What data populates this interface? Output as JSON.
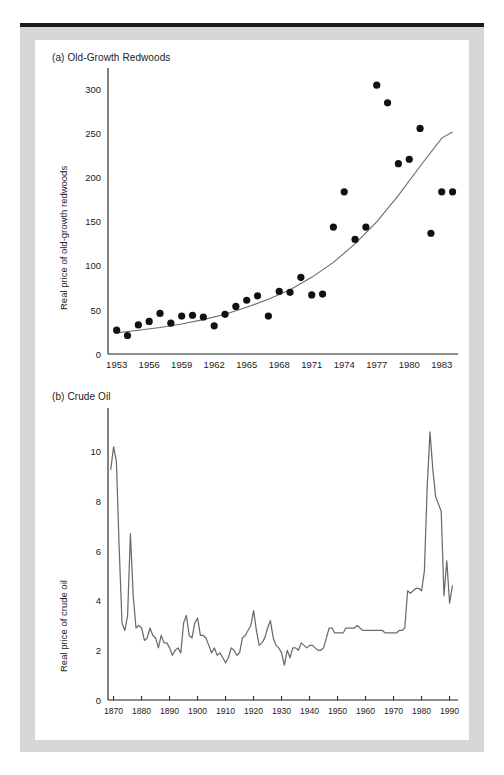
{
  "page": {
    "frame_color": "#d6d6d6",
    "rule_color": "#1a1a1a",
    "background": "#ffffff"
  },
  "panels": [
    {
      "key": "a",
      "label": "(a) Old-Growth Redwoods"
    },
    {
      "key": "b",
      "label": "(b) Crude Oil"
    }
  ],
  "chart_data": [
    {
      "type": "scatter",
      "title": "(a) Old-Growth Redwoods",
      "xlabel": "",
      "ylabel": "Real price of old-growth redwoods",
      "xlim": [
        1952.2,
        1984.5
      ],
      "ylim": [
        0,
        320
      ],
      "grid": false,
      "legend": null,
      "xticks": [
        1953,
        1956,
        1959,
        1962,
        1965,
        1968,
        1971,
        1974,
        1977,
        1980,
        1983
      ],
      "xticklabels": [
        "1953",
        "1956",
        "1959",
        "1962",
        "1965",
        "1968",
        "1971",
        "1974",
        "1977",
        "1980",
        "1983"
      ],
      "yticks": [
        0,
        50,
        100,
        150,
        200,
        250,
        300
      ],
      "yticklabels": [
        "0",
        "50",
        "100",
        "150",
        "200",
        "250",
        "300"
      ],
      "marker_color": "#111111",
      "fit_color": "#6b6b6b",
      "x": [
        1953,
        1954,
        1955,
        1956,
        1957,
        1958,
        1959,
        1960,
        1961,
        1962,
        1963,
        1964,
        1965,
        1966,
        1967,
        1968,
        1969,
        1970,
        1971,
        1972,
        1973,
        1974,
        1975,
        1976,
        1977,
        1978,
        1979,
        1980,
        1981,
        1982,
        1983,
        1984
      ],
      "y": [
        27,
        21,
        33,
        37,
        46,
        35,
        43,
        44,
        42,
        32,
        45,
        54,
        61,
        66,
        43,
        71,
        70,
        87,
        67,
        68,
        144,
        184,
        130,
        144,
        305,
        285,
        216,
        221,
        256,
        137,
        184,
        184
      ],
      "series": [
        {
          "name": "Real price of old-growth redwoods",
          "kind": "scatter",
          "values": [
            27,
            21,
            33,
            37,
            46,
            35,
            43,
            44,
            42,
            32,
            45,
            54,
            61,
            66,
            43,
            71,
            70,
            87,
            67,
            68,
            144,
            184,
            130,
            144,
            305,
            285,
            216,
            221,
            256,
            137,
            184,
            184
          ]
        },
        {
          "name": "Exponential trend fit",
          "kind": "line",
          "x": [
            1953,
            1955,
            1957,
            1959,
            1961,
            1963,
            1965,
            1967,
            1969,
            1971,
            1973,
            1975,
            1977,
            1979,
            1981,
            1983,
            1984
          ],
          "values": [
            24,
            27,
            30,
            34,
            39,
            45,
            53,
            62,
            73,
            87,
            104,
            125,
            150,
            180,
            213,
            245,
            252
          ]
        }
      ]
    },
    {
      "type": "line",
      "title": "(b) Crude Oil",
      "xlabel": "",
      "ylabel": "Real price of crude oil",
      "xlim": [
        1868,
        1993
      ],
      "ylim": [
        0,
        11.6
      ],
      "grid": false,
      "legend": null,
      "xticks": [
        1870,
        1880,
        1890,
        1900,
        1910,
        1920,
        1930,
        1940,
        1950,
        1960,
        1970,
        1980,
        1990
      ],
      "xticklabels": [
        "1870",
        "1880",
        "1890",
        "1900",
        "1910",
        "1920",
        "1930",
        "1940",
        "1950",
        "1960",
        "1970",
        "1980",
        "1990"
      ],
      "yticks": [
        0,
        2,
        4,
        6,
        8,
        10
      ],
      "yticklabels": [
        "0",
        "2",
        "4",
        "6",
        "8",
        "10"
      ],
      "line_color": "#6b6b6b",
      "x": [
        1869,
        1870,
        1871,
        1872,
        1873,
        1874,
        1875,
        1876,
        1877,
        1878,
        1879,
        1880,
        1881,
        1882,
        1883,
        1884,
        1885,
        1886,
        1887,
        1888,
        1889,
        1890,
        1891,
        1892,
        1893,
        1894,
        1895,
        1896,
        1897,
        1898,
        1899,
        1900,
        1901,
        1902,
        1903,
        1904,
        1905,
        1906,
        1907,
        1908,
        1909,
        1910,
        1911,
        1912,
        1913,
        1914,
        1915,
        1916,
        1917,
        1918,
        1919,
        1920,
        1921,
        1922,
        1923,
        1924,
        1925,
        1926,
        1927,
        1928,
        1929,
        1930,
        1931,
        1932,
        1933,
        1934,
        1935,
        1936,
        1937,
        1938,
        1939,
        1940,
        1941,
        1942,
        1943,
        1944,
        1945,
        1946,
        1947,
        1948,
        1949,
        1950,
        1951,
        1952,
        1953,
        1954,
        1955,
        1956,
        1957,
        1958,
        1959,
        1960,
        1961,
        1962,
        1963,
        1964,
        1965,
        1966,
        1967,
        1968,
        1969,
        1970,
        1971,
        1972,
        1973,
        1974,
        1975,
        1976,
        1977,
        1978,
        1979,
        1980,
        1981,
        1982,
        1983,
        1984,
        1985,
        1986,
        1987,
        1988,
        1989,
        1990,
        1991
      ],
      "y": [
        9.3,
        10.2,
        9.6,
        6.1,
        3.1,
        2.8,
        3.4,
        6.7,
        4.2,
        2.9,
        3.0,
        2.9,
        2.4,
        2.5,
        2.9,
        2.6,
        2.5,
        2.1,
        2.6,
        2.3,
        2.3,
        2.1,
        1.8,
        2.0,
        2.1,
        1.9,
        3.1,
        3.4,
        2.6,
        2.5,
        3.1,
        3.3,
        2.6,
        2.6,
        2.5,
        2.2,
        1.9,
        2.1,
        1.8,
        1.9,
        1.7,
        1.5,
        1.7,
        2.1,
        2.0,
        1.8,
        1.9,
        2.5,
        2.6,
        2.8,
        3.0,
        3.6,
        2.8,
        2.2,
        2.3,
        2.5,
        2.9,
        3.2,
        2.5,
        2.2,
        2.1,
        1.9,
        1.4,
        2.0,
        1.7,
        2.1,
        2.1,
        2.0,
        2.3,
        2.2,
        2.1,
        2.2,
        2.2,
        2.1,
        2.0,
        2.0,
        2.1,
        2.5,
        2.9,
        2.9,
        2.7,
        2.7,
        2.7,
        2.7,
        2.9,
        2.9,
        2.9,
        2.9,
        3.0,
        2.9,
        2.8,
        2.8,
        2.8,
        2.8,
        2.8,
        2.8,
        2.8,
        2.8,
        2.7,
        2.7,
        2.7,
        2.7,
        2.7,
        2.8,
        2.8,
        2.9,
        4.4,
        4.3,
        4.4,
        4.5,
        4.5,
        4.4,
        5.2,
        8.6,
        10.8,
        9.3,
        8.2,
        7.9,
        7.6,
        4.2,
        5.6,
        3.9,
        4.6,
        5.4,
        3.8
      ]
    }
  ]
}
